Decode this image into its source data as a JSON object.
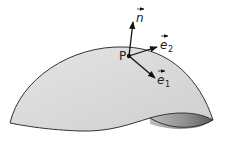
{
  "diagram": {
    "point_label": "P",
    "vectors": [
      {
        "name": "n",
        "label": "n",
        "subscript": ""
      },
      {
        "name": "e2",
        "label": "e",
        "subscript": "2"
      },
      {
        "name": "e1",
        "label": "e",
        "subscript": "1"
      }
    ],
    "colors": {
      "surface_fill": "#d9d9d9",
      "surface_stroke": "#333333",
      "underside": "#8a8a8a",
      "vector": "#111111"
    }
  }
}
